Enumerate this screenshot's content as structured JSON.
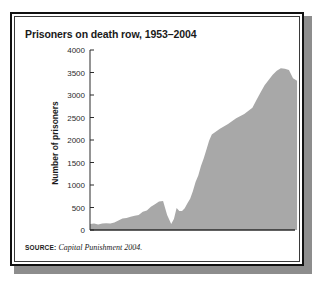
{
  "figure": {
    "title": "Prisoners on death row, 1953–2004",
    "source_label": "SOURCE:",
    "source_text": "Capital Punishment 2004.",
    "frame_color": "#111111",
    "background_color": "#ffffff"
  },
  "chart_data": {
    "type": "area",
    "title": "Prisoners on death row, 1953–2004",
    "xlabel": "",
    "ylabel": "Number of prisoners",
    "ylim": [
      0,
      4000
    ],
    "xlim": [
      1953,
      2004
    ],
    "grid": false,
    "legend": false,
    "fill_color": "#a8a8a8",
    "axis_color": "#2b2b2b",
    "ytick_labels": [
      "0",
      "500",
      "1000",
      "1500",
      "2000",
      "2500",
      "3000",
      "3500",
      "4000"
    ],
    "ytick_values": [
      0,
      500,
      1000,
      1500,
      2000,
      2500,
      3000,
      3500,
      4000
    ],
    "xtick_labels": [
      "1953",
      "1963",
      "1973",
      "1988",
      "1993",
      "2003"
    ],
    "xtick_values": [
      1953,
      1963,
      1973,
      1988,
      1993,
      2003
    ],
    "x": [
      1953,
      1954,
      1955,
      1956,
      1957,
      1958,
      1959,
      1960,
      1961,
      1962,
      1963,
      1964,
      1965,
      1966,
      1967,
      1968,
      1969,
      1970,
      1971,
      1972,
      1973,
      1974,
      1975,
      1976,
      1977,
      1978,
      1979,
      1980,
      1981,
      1982,
      1983,
      1984,
      1985,
      1986,
      1987,
      1988,
      1989,
      1990,
      1991,
      1992,
      1993,
      1994,
      1995,
      1996,
      1997,
      1998,
      1999,
      2000,
      2001,
      2002,
      2003,
      2004
    ],
    "values": [
      131,
      147,
      125,
      146,
      151,
      147,
      164,
      210,
      257,
      267,
      297,
      315,
      331,
      406,
      435,
      517,
      575,
      631,
      642,
      334,
      134,
      244,
      488,
      420,
      423,
      482,
      593,
      697,
      860,
      1066,
      1209,
      1420,
      1591,
      1781,
      1984,
      2124,
      2250,
      2356,
      2482,
      2580,
      2716,
      2890,
      3054,
      3219,
      3335,
      3452,
      3540,
      3593,
      3581,
      3557,
      3374,
      3315
    ],
    "series": [
      {
        "name": "Number of prisoners on death row",
        "values": [
          131,
          147,
          125,
          146,
          151,
          147,
          164,
          210,
          257,
          267,
          297,
          315,
          331,
          406,
          435,
          517,
          575,
          631,
          642,
          334,
          134,
          244,
          488,
          420,
          423,
          482,
          593,
          697,
          860,
          1066,
          1209,
          1420,
          1591,
          1781,
          1984,
          2124,
          2250,
          2356,
          2482,
          2580,
          2716,
          2890,
          3054,
          3219,
          3335,
          3452,
          3540,
          3593,
          3581,
          3557,
          3374,
          3315
        ]
      }
    ],
    "annotations": [
      {
        "label": "pre-Furman peak",
        "x": 1971,
        "y": 642
      },
      {
        "label": "Furman v. Georgia low point",
        "x": 1973,
        "y": 134
      },
      {
        "label": "modern peak",
        "x": 2000,
        "y": 3593
      }
    ]
  }
}
